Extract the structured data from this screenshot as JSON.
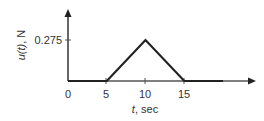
{
  "chart_data": {
    "type": "line",
    "title": "",
    "xlabel": "t, sec",
    "ylabel": "u(t), N",
    "x": [
      0,
      5,
      10,
      15,
      20
    ],
    "values": [
      0,
      0,
      0.275,
      0,
      0
    ],
    "x_ticks": [
      "0",
      "5",
      "10",
      "15"
    ],
    "y_ticks": [
      "0.275"
    ],
    "xlim": [
      0,
      24
    ],
    "ylim": [
      0,
      0.45
    ],
    "grid": false,
    "legend": null,
    "line_color": "#222222",
    "axis_color": "#555555"
  },
  "labels": {
    "x_tick_0": "0",
    "x_tick_5": "5",
    "x_tick_10": "10",
    "x_tick_15": "15",
    "y_tick": "0.275",
    "xlabel_italic": "t",
    "xlabel_rest": ", sec",
    "ylabel_italic": "u(t)",
    "ylabel_rest": ", N"
  }
}
